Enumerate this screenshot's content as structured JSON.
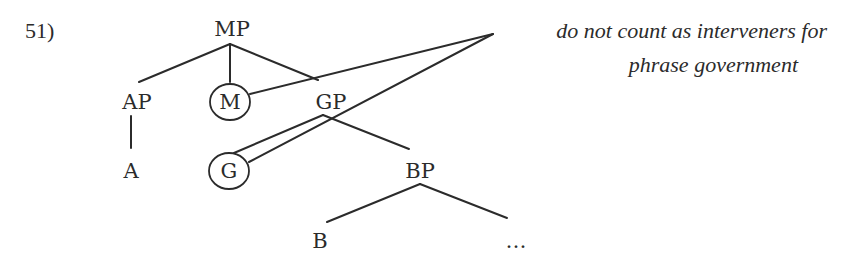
{
  "example_number": "51)",
  "tree": {
    "root": "MP",
    "nodes": {
      "mp": "MP",
      "ap": "AP",
      "m": "M",
      "gp": "GP",
      "a": "A",
      "g": "G",
      "bp": "BP",
      "b": "B",
      "ellipsis": "…"
    },
    "edges": [
      [
        "MP",
        "AP"
      ],
      [
        "MP",
        "M"
      ],
      [
        "MP",
        "GP"
      ],
      [
        "AP",
        "A"
      ],
      [
        "GP",
        "G"
      ],
      [
        "GP",
        "BP"
      ],
      [
        "BP",
        "B"
      ],
      [
        "BP",
        "…"
      ]
    ],
    "circled": [
      "M",
      "G"
    ]
  },
  "annotation": {
    "line1": "do not count as interveners for",
    "line2": "phrase government",
    "points_to": [
      "M",
      "G"
    ]
  },
  "colors": {
    "ink": "#2b2b2b",
    "background": "#ffffff"
  }
}
